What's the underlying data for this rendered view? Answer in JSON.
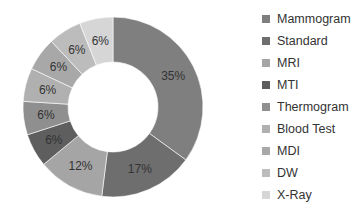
{
  "chart_data": {
    "type": "pie",
    "variant": "donut",
    "title": "",
    "categories": [
      "Mammogram",
      "Standard",
      "MRI",
      "MTI",
      "Thermogram",
      "Blood Test",
      "MDI",
      "DW",
      "X-Ray"
    ],
    "values": [
      35,
      17,
      12,
      6,
      6,
      6,
      6,
      6,
      6
    ],
    "value_labels": [
      "35%",
      "17%",
      "12%",
      "6%",
      "6%",
      "6%",
      "6%",
      "6%",
      "6%"
    ],
    "unit": "%",
    "colors": [
      "#7f7f7f",
      "#6e6e6e",
      "#a5a5a5",
      "#5e5e5e",
      "#8f8f8f",
      "#b0b0b0",
      "#a8a8a8",
      "#bcbcbc",
      "#d6d6d6"
    ],
    "start_angle_deg": 0,
    "direction": "clockwise",
    "legend_position": "right",
    "grid": false
  },
  "legend": {
    "items": [
      {
        "label": "Mammogram",
        "color": "#7f7f7f"
      },
      {
        "label": "Standard",
        "color": "#6e6e6e"
      },
      {
        "label": "MRI",
        "color": "#a5a5a5"
      },
      {
        "label": "MTI",
        "color": "#5e5e5e"
      },
      {
        "label": "Thermogram",
        "color": "#8f8f8f"
      },
      {
        "label": "Blood Test",
        "color": "#b0b0b0"
      },
      {
        "label": "MDI",
        "color": "#a8a8a8"
      },
      {
        "label": "DW",
        "color": "#bcbcbc"
      },
      {
        "label": "X-Ray",
        "color": "#d6d6d6"
      }
    ]
  }
}
